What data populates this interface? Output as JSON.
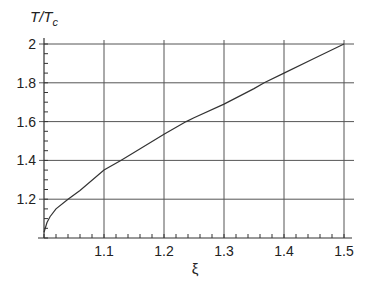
{
  "chart_data": {
    "type": "line",
    "title": "",
    "xlabel": "ξ",
    "ylabel": "T/T_c",
    "ylabel_main": "T/T",
    "ylabel_sub": "c",
    "xlim": [
      1.0,
      1.5
    ],
    "ylim": [
      1.0,
      2.0
    ],
    "grid": true,
    "x_ticks": [
      "1.1",
      "1.2",
      "1.3",
      "1.4",
      "1.5"
    ],
    "y_ticks": [
      "1.2",
      "1.4",
      "1.6",
      "1.8",
      "2"
    ],
    "series": [
      {
        "name": "T/T_c vs ξ",
        "x": [
          1.0,
          1.005,
          1.01,
          1.02,
          1.04,
          1.06,
          1.1,
          1.128,
          1.15,
          1.2,
          1.237,
          1.25,
          1.3,
          1.35,
          1.367,
          1.4,
          1.45,
          1.5
        ],
        "y": [
          1.03,
          1.08,
          1.11,
          1.15,
          1.2,
          1.245,
          1.35,
          1.4,
          1.44,
          1.535,
          1.6,
          1.62,
          1.69,
          1.77,
          1.8,
          1.85,
          1.925,
          2.0
        ]
      }
    ]
  }
}
